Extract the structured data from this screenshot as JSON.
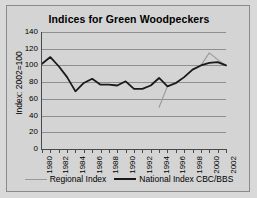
{
  "chart_data": {
    "type": "line",
    "title": "Indices for Green Woodpeckers",
    "xlabel": "",
    "ylabel": "Index: 2002=100",
    "ylim": [
      0,
      140
    ],
    "ytick_values": [
      140,
      120,
      100,
      80,
      60,
      40,
      20,
      0
    ],
    "ytick_labels": [
      "140",
      "120",
      "100",
      "80",
      "60",
      "40",
      "20",
      "0"
    ],
    "grid": true,
    "legend_position": "bottom",
    "x": [
      1980,
      1981,
      1982,
      1983,
      1984,
      1985,
      1986,
      1987,
      1988,
      1989,
      1990,
      1991,
      1992,
      1993,
      1994,
      1995,
      1996,
      1997,
      1998,
      1999,
      2000,
      2001,
      2002
    ],
    "xtick_labels": [
      "1980",
      "1982",
      "1984",
      "1986",
      "1988",
      "1990",
      "1992",
      "1994",
      "1996",
      "1998",
      "2000",
      "2002"
    ],
    "xtick_values": [
      1980,
      1982,
      1984,
      1986,
      1988,
      1990,
      1992,
      1994,
      1996,
      1998,
      2000,
      2002
    ],
    "series": [
      {
        "name": "Regional Index",
        "color": "#9a9a9a",
        "x": [
          1994,
          1995,
          1996,
          1997,
          1998,
          1999,
          2000,
          2001,
          2002
        ],
        "values": [
          50,
          75,
          78,
          86,
          95,
          100,
          115,
          107,
          100
        ]
      },
      {
        "name": "National Index CBC/BBS",
        "color": "#1a1a1a",
        "x": [
          1980,
          1981,
          1982,
          1983,
          1984,
          1985,
          1986,
          1987,
          1988,
          1989,
          1990,
          1991,
          1992,
          1993,
          1994,
          1995,
          1996,
          1997,
          1998,
          1999,
          2000,
          2001,
          2002
        ],
        "values": [
          102,
          110,
          99,
          86,
          69,
          79,
          84,
          77,
          77,
          76,
          81,
          72,
          72,
          76,
          85,
          75,
          79,
          86,
          95,
          100,
          103,
          104,
          100
        ]
      }
    ]
  },
  "legend": {
    "entries": [
      {
        "label": "Regional Index"
      },
      {
        "label": "National Index CBC/BBS"
      }
    ]
  }
}
